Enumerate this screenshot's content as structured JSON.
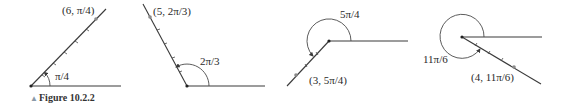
{
  "caption": {
    "marker": "▲",
    "text": "Figure 10.2.2"
  },
  "colors": {
    "line": "#3a3a3a",
    "point": "#8a8a8a",
    "caption_marker": "#8a9aa8"
  },
  "panels": [
    {
      "point_label": "(6, π/4)",
      "angle_label": "π/4"
    },
    {
      "point_label": "(5, 2π/3)",
      "angle_label": "2π/3"
    },
    {
      "point_label": "(3, 5π/4)",
      "angle_label": "5π/4"
    },
    {
      "point_label": "(4, 11π/6)",
      "angle_label": "11π/6"
    }
  ]
}
